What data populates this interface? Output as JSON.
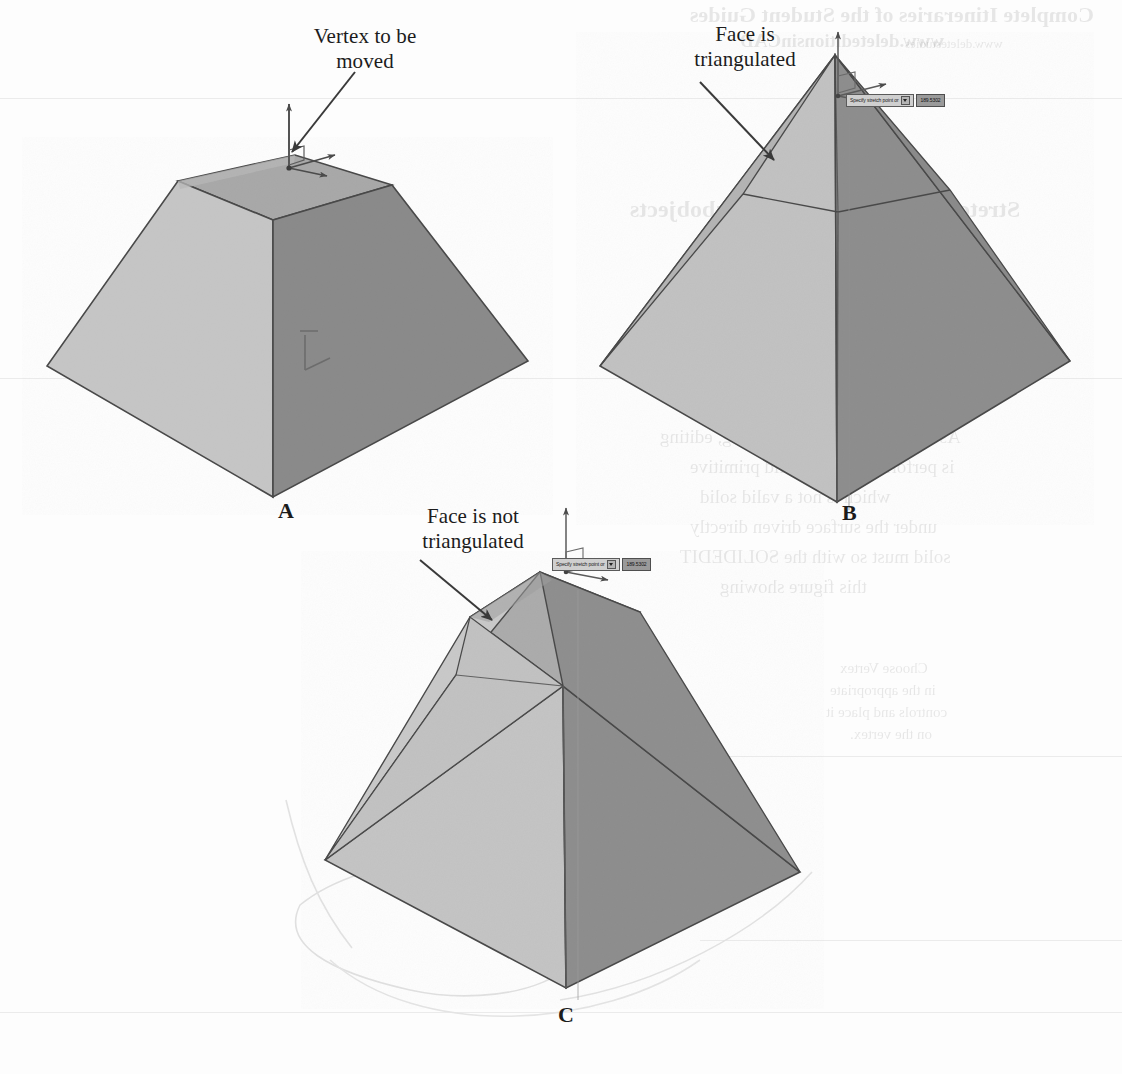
{
  "page": {
    "background_color": "#fdfdfd",
    "ink_color": "#1c1c1c"
  },
  "figures": [
    {
      "id": "A",
      "letter": "A",
      "callout": "Vertex to be\nmoved",
      "description": "Frustum solid with move gizmo on top face vertex",
      "gizmo": "3d-move-gizmo"
    },
    {
      "id": "B",
      "letter": "B",
      "callout": "Face is\ntriangulated",
      "description": "Pyramid solid whose face has been triangulated after vertex move",
      "gizmo": "3d-move-gizmo",
      "tooltip": {
        "prompt": "Specify stretch point or",
        "coords": "189.5302"
      }
    },
    {
      "id": "C",
      "letter": "C",
      "callout": "Face is not\ntriangulated",
      "description": "Solid whose face remained planar so it was not triangulated",
      "gizmo": "3d-move-gizmo",
      "tooltip": {
        "prompt": "Specify stretch point or",
        "coords": "189.5302"
      }
    }
  ],
  "colors": {
    "face_light": "#c6c6c6",
    "face_mid": "#ababab",
    "face_dark": "#8b8b8b",
    "face_top": "#a6a6a6",
    "edge": "#4a4a4a",
    "leader": "#3a3a3a",
    "ghost": "#dcdcdc"
  },
  "bleed_through": {
    "note": "Faint mirrored show-through text from the reverse side of the scanned page",
    "lines": [
      {
        "text": "Complete Itineraries of the Student Guides",
        "x": 690,
        "y": 2,
        "size": 22,
        "weight": "bold"
      },
      {
        "text": "www.deleteditionsinCAD",
        "x": 740,
        "y": 30,
        "size": 19,
        "weight": "bold"
      },
      {
        "text": "www.deletestudies",
        "x": 905,
        "y": 36,
        "size": 13,
        "weight": "normal"
      },
      {
        "text": "Stretching Solid Faces and Subobjects",
        "x": 630,
        "y": 196,
        "size": 24,
        "weight": "bold"
      },
      {
        "text": "When you drag a vertex of a face",
        "x": 700,
        "y": 246,
        "size": 19,
        "weight": "normal"
      },
      {
        "text": "such that it is no longer planar",
        "x": 700,
        "y": 276,
        "size": 19,
        "weight": "normal"
      },
      {
        "text": "AutoCAD automatically triangulates",
        "x": 690,
        "y": 306,
        "size": 19,
        "weight": "normal"
      },
      {
        "text": "it. Simply put: a face should be flat",
        "x": 680,
        "y": 336,
        "size": 19,
        "weight": "normal"
      },
      {
        "text": "and in most of the cases. When editing multiple",
        "x": 660,
        "y": 366,
        "size": 19,
        "weight": "normal"
      },
      {
        "text": "triangulation, ensure you",
        "x": 690,
        "y": 396,
        "size": 19,
        "weight": "normal"
      },
      {
        "text": "As with other subobject editing, editing",
        "x": 660,
        "y": 426,
        "size": 19,
        "weight": "normal"
      },
      {
        "text": "is performed on the solid primitive",
        "x": 690,
        "y": 456,
        "size": 19,
        "weight": "normal"
      },
      {
        "text": "which is not a valid solid",
        "x": 700,
        "y": 486,
        "size": 19,
        "weight": "normal"
      },
      {
        "text": "under the surface driven directly",
        "x": 690,
        "y": 516,
        "size": 19,
        "weight": "normal"
      },
      {
        "text": "solid must so with the SOLIDEDIT",
        "x": 680,
        "y": 546,
        "size": 19,
        "weight": "normal"
      },
      {
        "text": "this figure showing",
        "x": 720,
        "y": 576,
        "size": 19,
        "weight": "normal"
      },
      {
        "text": "Choose Vertex",
        "x": 840,
        "y": 660,
        "size": 15,
        "weight": "normal"
      },
      {
        "text": "in the appropriate",
        "x": 830,
        "y": 682,
        "size": 15,
        "weight": "normal"
      },
      {
        "text": "controls and place it",
        "x": 826,
        "y": 704,
        "size": 15,
        "weight": "normal"
      },
      {
        "text": "on the vertex.",
        "x": 850,
        "y": 726,
        "size": 15,
        "weight": "normal"
      }
    ],
    "rules": [
      {
        "x": 0,
        "y": 98,
        "width": 1122
      },
      {
        "x": 0,
        "y": 378,
        "width": 1122
      },
      {
        "x": 700,
        "y": 756,
        "width": 422
      },
      {
        "x": 700,
        "y": 940,
        "width": 422
      },
      {
        "x": 0,
        "y": 1012,
        "width": 1122
      }
    ]
  }
}
